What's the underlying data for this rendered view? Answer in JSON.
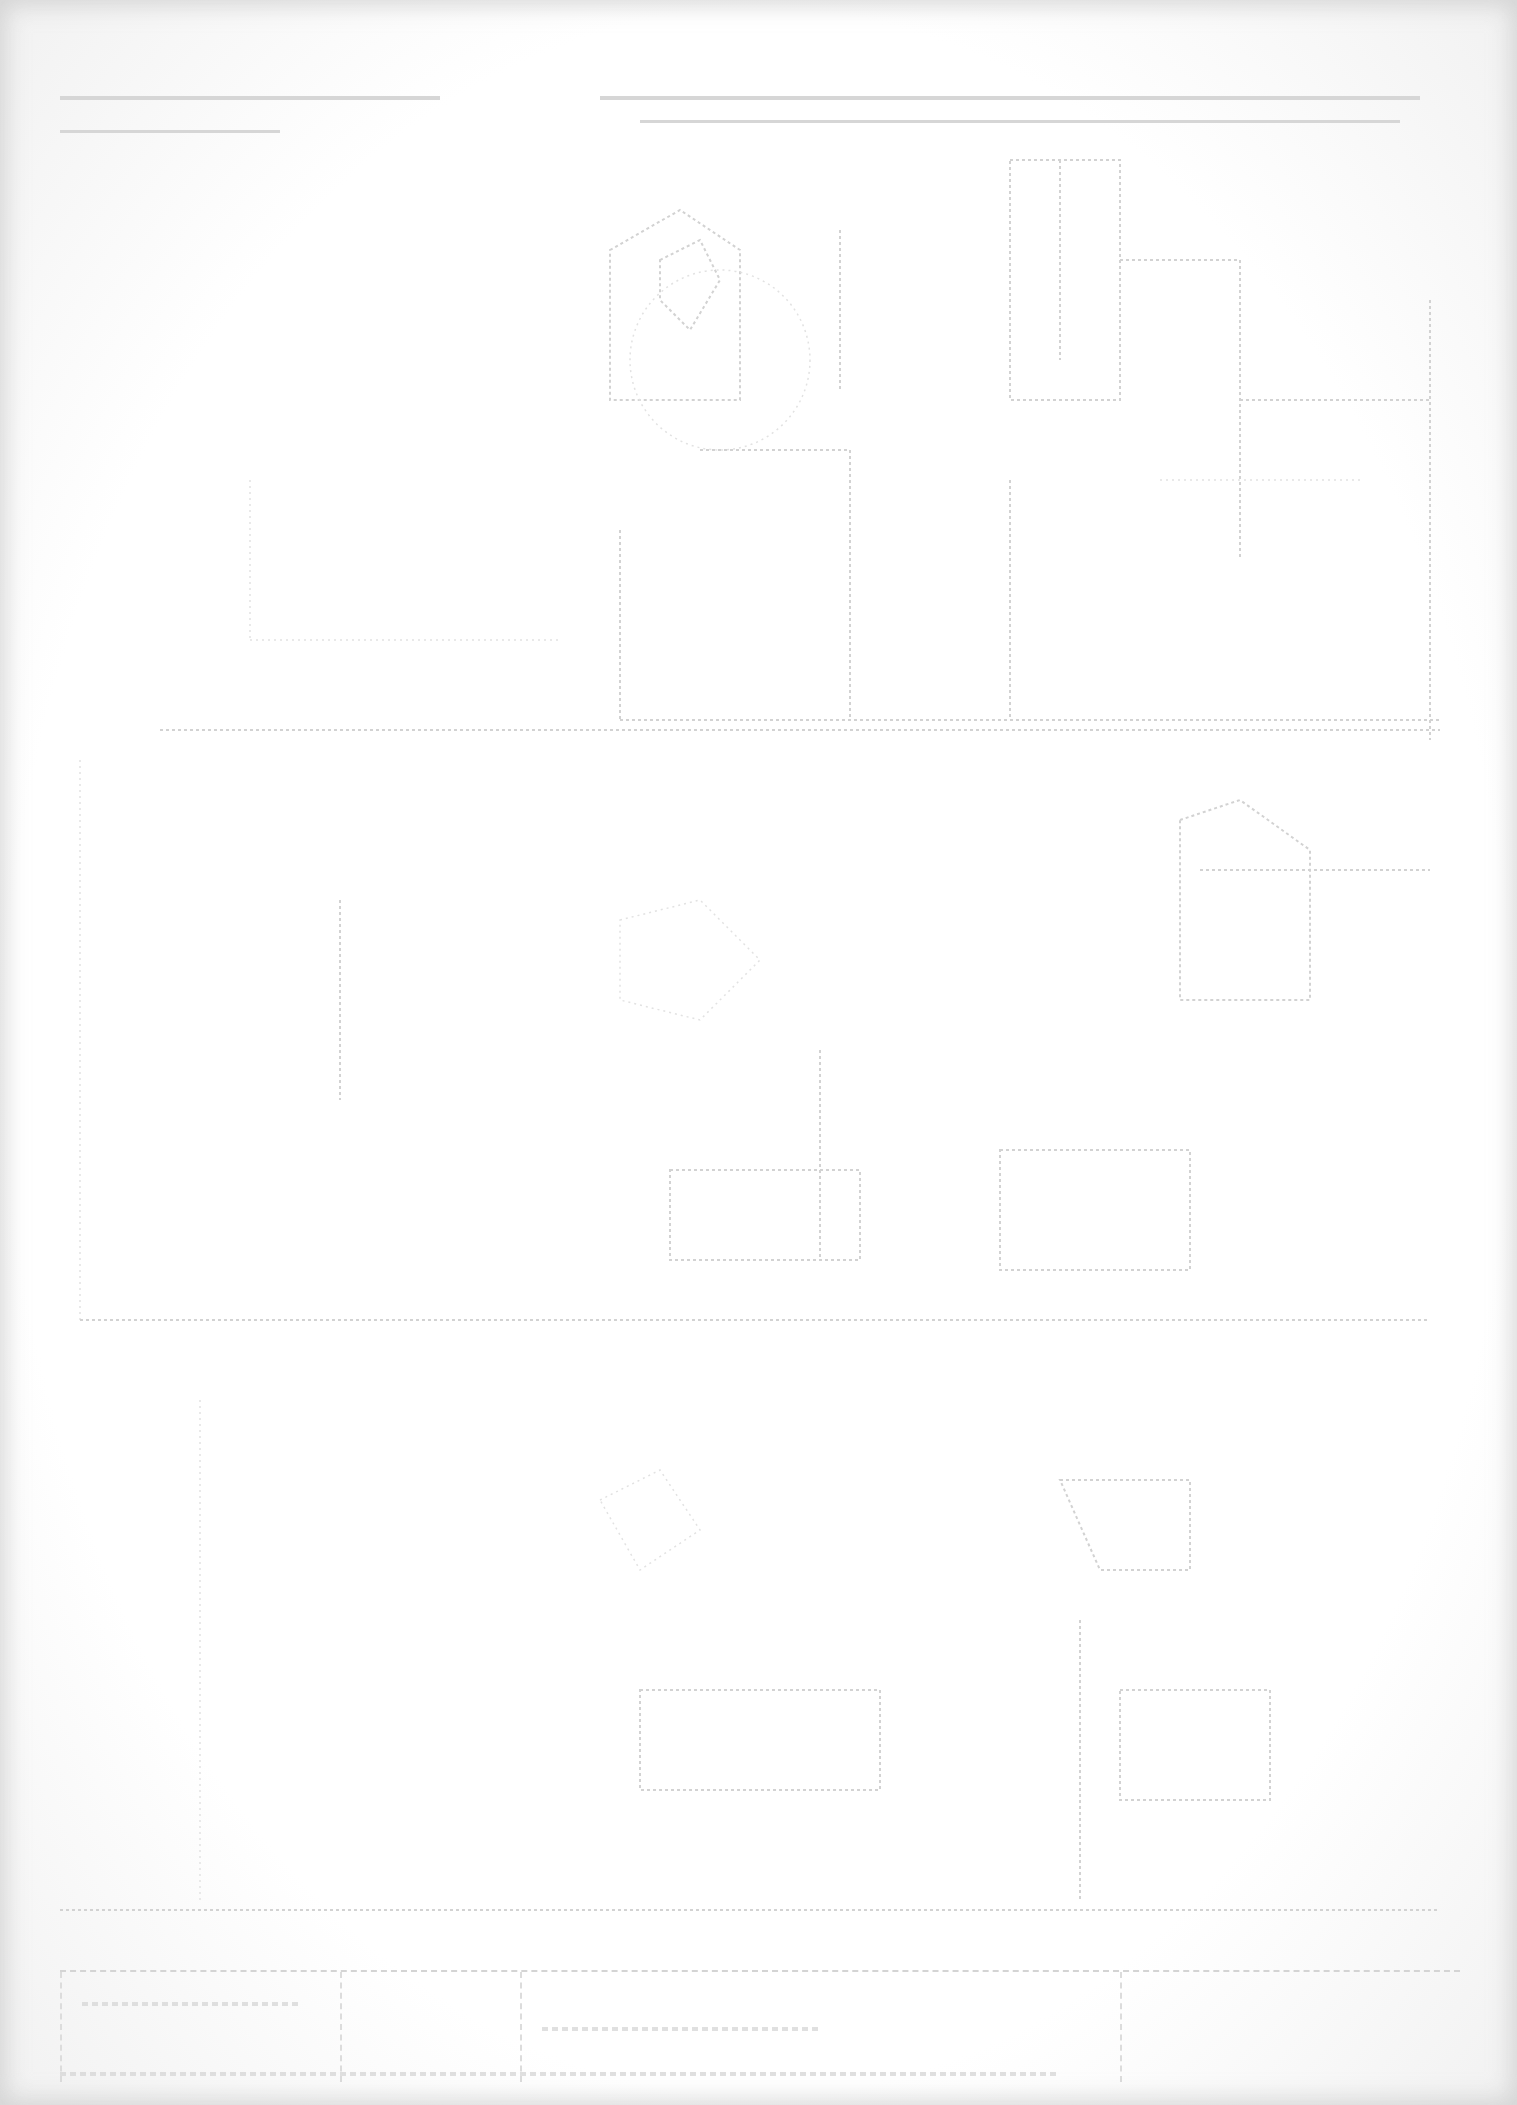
{
  "document": {
    "type": "scanned technical drawing (floor plan)",
    "legibility": "text not readable - heavily faded scan",
    "background_color": "#ffffff",
    "line_color": "#d2d2d2"
  },
  "header_text_lines": [
    {
      "text": "",
      "x": 60,
      "y": 100,
      "width": 380
    },
    {
      "text": "",
      "x": 600,
      "y": 100,
      "width": 820
    },
    {
      "text": "",
      "x": 60,
      "y": 130,
      "width": 220
    }
  ],
  "title_block": {
    "cells": [
      {
        "text": ""
      },
      {
        "text": ""
      },
      {
        "text": ""
      },
      {
        "text": ""
      }
    ]
  }
}
